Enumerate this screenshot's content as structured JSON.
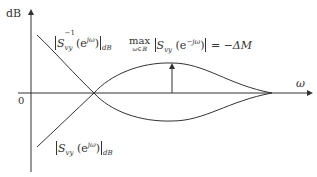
{
  "axes": {
    "y_label": "dB",
    "x_label": "ω",
    "origin_label": "0"
  },
  "curves": {
    "upper_label": {
      "prefix": "S",
      "sub": "vy",
      "sup": "−1",
      "arg": "(e",
      "arg_sup": "jω",
      "arg_close": ")",
      "unit": "dB"
    },
    "lower_label": {
      "prefix": "S",
      "sub": "vy",
      "arg": "(e",
      "arg_sup": "jω",
      "arg_close": ")",
      "unit": "dB"
    }
  },
  "annotation": {
    "max_word": "max",
    "max_sub": "ω∈ℝ",
    "func": "S",
    "func_sub": "vy",
    "arg": "(e",
    "arg_sup": "−jω",
    "arg_close": ")",
    "rhs": "= −ΔM"
  },
  "colors": {
    "line": "#333333",
    "background": "#ffffff"
  }
}
